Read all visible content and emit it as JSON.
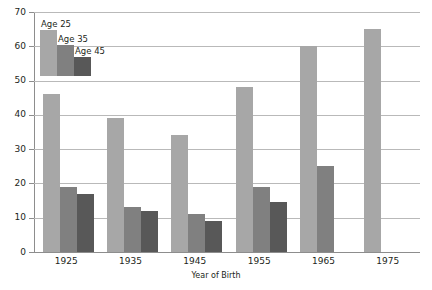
{
  "chart_data": {
    "type": "bar",
    "title": "",
    "xlabel": "Year of Birth",
    "ylabel": "",
    "categories": [
      "1925",
      "1935",
      "1945",
      "1955",
      "1965",
      "1975"
    ],
    "series": [
      {
        "name": "Age 25",
        "color": "#a7a7a7",
        "values": [
          46,
          39,
          34,
          48,
          60,
          65
        ]
      },
      {
        "name": "Age 35",
        "color": "#808080",
        "values": [
          19,
          13,
          11,
          19,
          25,
          null
        ]
      },
      {
        "name": "Age 45",
        "color": "#585858",
        "values": [
          17,
          12,
          9,
          14.5,
          null,
          null
        ]
      }
    ],
    "ylim": [
      0,
      70
    ],
    "yticks": [
      0,
      10,
      20,
      30,
      40,
      50,
      60,
      70
    ],
    "ytick_labels": [
      "0",
      "10",
      "20",
      "30",
      "40",
      "50",
      "60",
      "70"
    ],
    "grid": "horizontal",
    "legend_position": "top-left",
    "legend_style": "bar-swatch-diagonal"
  },
  "legend": {
    "entries": [
      {
        "label": "Age 25",
        "color": "#a7a7a7",
        "height": 65
      },
      {
        "label": "Age 35",
        "color": "#808080",
        "height": 60
      },
      {
        "label": "Age 45",
        "color": "#585858",
        "height": 56
      }
    ]
  },
  "colors": {
    "gridline": "#b9b9b9",
    "axis": "#8d8d8d",
    "text": "#231f20",
    "background": "#ffffff"
  }
}
